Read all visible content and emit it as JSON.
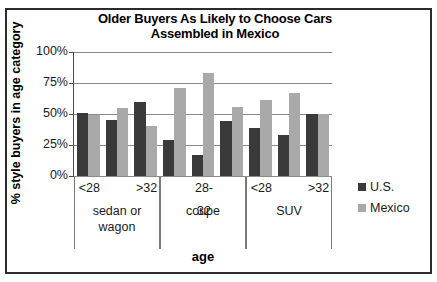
{
  "chart_data": {
    "type": "bar",
    "title": "Older Buyers As Likely to Choose Cars Assembled in Mexico",
    "title_lines": [
      "Older Buyers As Likely to Choose Cars",
      "Assembled in Mexico"
    ],
    "xlabel": "age",
    "ylabel": "% style buyers in age category",
    "ylim": [
      0,
      100
    ],
    "yticks": [
      0,
      25,
      50,
      75,
      100
    ],
    "ytick_labels": [
      "0%",
      "25%",
      "50%",
      "75%",
      "100%"
    ],
    "grid": true,
    "legend_position": "right",
    "categories": [
      "<28",
      "28-32",
      ">32",
      "<28",
      "28-32",
      ">32",
      "<28",
      "28-32",
      ">32"
    ],
    "group_labels": [
      "sedan or wagon",
      "coupe",
      "SUV"
    ],
    "group_label_lines": [
      [
        "sedan or",
        "wagon"
      ],
      [
        "coupe"
      ],
      [
        "SUV"
      ]
    ],
    "visible_age_ticks": [
      "<28",
      "",
      ">32",
      "",
      "28-32",
      "",
      "<28",
      "",
      ">32"
    ],
    "series": [
      {
        "name": "U.S.",
        "color": "#3a3a3a",
        "values": [
          51,
          45,
          60,
          29,
          17,
          44,
          39,
          33,
          50
        ]
      },
      {
        "name": "Mexico",
        "color": "#a9a9a9",
        "values": [
          49,
          55,
          40,
          71,
          83,
          56,
          61,
          67,
          50
        ]
      }
    ]
  },
  "legend": {
    "items": [
      {
        "label": "U.S.",
        "swatch": "us"
      },
      {
        "label": "Mexico",
        "swatch": "mx"
      }
    ]
  }
}
